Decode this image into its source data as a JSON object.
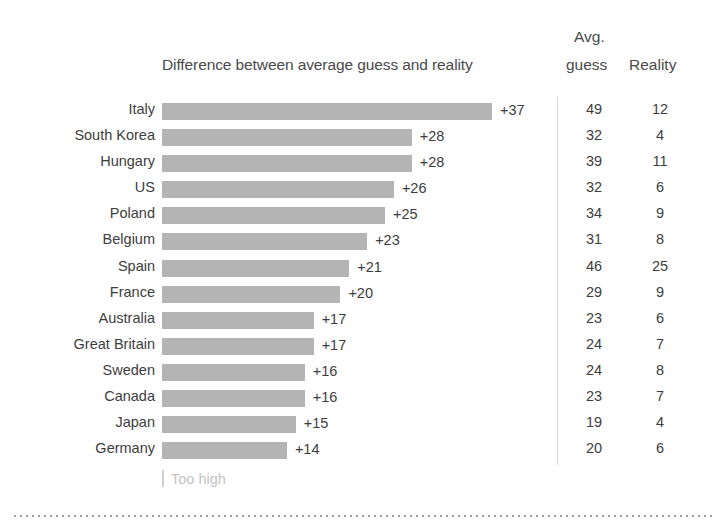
{
  "header": {
    "chart_title": "Difference between average guess and reality",
    "avg_line1": "Avg.",
    "avg_line2": "guess",
    "reality": "Reality"
  },
  "legend": {
    "too_high_label": "Too high",
    "tick_icon": "vertical-tick-icon"
  },
  "colors": {
    "bar": "#b4b4b4",
    "text": "#3d3d3d",
    "divider": "#d8d8d8",
    "legend_text": "#c4c4c4",
    "dotted_rule": "#9a9a9a"
  },
  "chart_data": {
    "type": "bar",
    "title": "Difference between average guess and reality",
    "xlabel": "",
    "ylabel": "",
    "orientation": "horizontal",
    "grid": false,
    "legend_position": "bottom-left",
    "legend_entries": [
      "Too high"
    ],
    "xlim": [
      0,
      40
    ],
    "categories": [
      "Italy",
      "South Korea",
      "Hungary",
      "US",
      "Poland",
      "Belgium",
      "Spain",
      "France",
      "Australia",
      "Great Britain",
      "Sweden",
      "Canada",
      "Japan",
      "Germany"
    ],
    "values": [
      37,
      28,
      28,
      26,
      25,
      23,
      21,
      20,
      17,
      17,
      16,
      16,
      15,
      14
    ],
    "value_labels": [
      "+37",
      "+28",
      "+28",
      "+26",
      "+25",
      "+23",
      "+21",
      "+20",
      "+17",
      "+17",
      "+16",
      "+16",
      "+15",
      "+14"
    ],
    "series": [
      {
        "name": "Difference between average guess and reality",
        "values": [
          37,
          28,
          28,
          26,
          25,
          23,
          21,
          20,
          17,
          17,
          16,
          16,
          15,
          14
        ]
      },
      {
        "name": "Avg. guess",
        "values": [
          49,
          32,
          39,
          32,
          34,
          31,
          46,
          29,
          23,
          24,
          24,
          23,
          19,
          20
        ]
      },
      {
        "name": "Reality",
        "values": [
          12,
          4,
          11,
          6,
          9,
          8,
          25,
          9,
          6,
          7,
          8,
          7,
          4,
          6
        ]
      }
    ],
    "table_columns": [
      "Country",
      "Difference",
      "Avg. guess",
      "Reality"
    ],
    "rows": [
      {
        "country": "Italy",
        "diff": "+37",
        "diff_value": 37,
        "avg_guess": "49",
        "reality": "12"
      },
      {
        "country": "South Korea",
        "diff": "+28",
        "diff_value": 28,
        "avg_guess": "32",
        "reality": "4"
      },
      {
        "country": "Hungary",
        "diff": "+28",
        "diff_value": 28,
        "avg_guess": "39",
        "reality": "11"
      },
      {
        "country": "US",
        "diff": "+26",
        "diff_value": 26,
        "avg_guess": "32",
        "reality": "6"
      },
      {
        "country": "Poland",
        "diff": "+25",
        "diff_value": 25,
        "avg_guess": "34",
        "reality": "9"
      },
      {
        "country": "Belgium",
        "diff": "+23",
        "diff_value": 23,
        "avg_guess": "31",
        "reality": "8"
      },
      {
        "country": "Spain",
        "diff": "+21",
        "diff_value": 21,
        "avg_guess": "46",
        "reality": "25"
      },
      {
        "country": "France",
        "diff": "+20",
        "diff_value": 20,
        "avg_guess": "29",
        "reality": "9"
      },
      {
        "country": "Australia",
        "diff": "+17",
        "diff_value": 17,
        "avg_guess": "23",
        "reality": "6"
      },
      {
        "country": "Great Britain",
        "diff": "+17",
        "diff_value": 17,
        "avg_guess": "24",
        "reality": "7"
      },
      {
        "country": "Sweden",
        "diff": "+16",
        "diff_value": 16,
        "avg_guess": "24",
        "reality": "8"
      },
      {
        "country": "Canada",
        "diff": "+16",
        "diff_value": 16,
        "avg_guess": "23",
        "reality": "7"
      },
      {
        "country": "Japan",
        "diff": "+15",
        "diff_value": 15,
        "avg_guess": "19",
        "reality": "4"
      },
      {
        "country": "Germany",
        "diff": "+14",
        "diff_value": 14,
        "avg_guess": "20",
        "reality": "6"
      }
    ]
  }
}
